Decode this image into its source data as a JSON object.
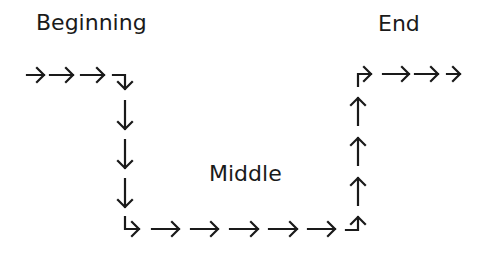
{
  "labels": {
    "start": "Beginning",
    "middle": "Middle",
    "end": "End"
  },
  "colors": {
    "stroke": "#1a1a1a",
    "background": "#ffffff"
  },
  "diagram": {
    "segments": [
      {
        "name": "top-left-row",
        "direction": "right",
        "count": 3
      },
      {
        "name": "corner-right-to-down",
        "direction": "down"
      },
      {
        "name": "left-column",
        "direction": "down",
        "count": 3
      },
      {
        "name": "corner-down-to-right",
        "direction": "right"
      },
      {
        "name": "bottom-row",
        "direction": "right",
        "count": 5
      },
      {
        "name": "corner-right-to-up",
        "direction": "up"
      },
      {
        "name": "right-column",
        "direction": "up",
        "count": 3
      },
      {
        "name": "corner-up-to-right",
        "direction": "right"
      },
      {
        "name": "top-right-row",
        "direction": "right",
        "count": 3
      }
    ]
  }
}
